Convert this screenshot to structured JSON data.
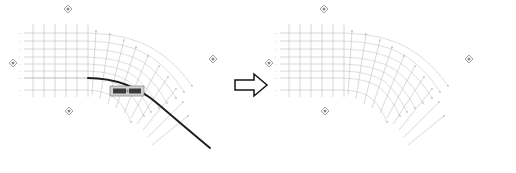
{
  "figure": {
    "panels": [
      {
        "id": "before",
        "label": "Before",
        "has_bold_curve": true,
        "has_tooltip": true,
        "bold_curve_name": "selected-boundary-curve"
      },
      {
        "id": "after",
        "label": "After",
        "has_bold_curve": false,
        "has_tooltip": false,
        "bold_curve_name": ""
      }
    ],
    "connector": {
      "icon": "right-arrow-icon",
      "label": "transforms to"
    },
    "grid": {
      "straight_columns": 6,
      "straight_rows": 8,
      "radial_lines": 10,
      "arc_count": 8,
      "line_color": "#b9b9b9",
      "arc_color": "#c2c2c2",
      "node_color": "#9a9a9a",
      "bold_curve_color": "#1c1c1c"
    },
    "markers": {
      "icon": "diamond-reference-marker",
      "color": "#8a8a8a",
      "positions": [
        "top",
        "left",
        "bottom",
        "right"
      ]
    },
    "tooltip": {
      "name": "selection-tooltip",
      "field_a": "",
      "field_b": "",
      "background": "#d2d2d2",
      "border": "#6e6e6e"
    },
    "tick_labels_left": [
      "8",
      "7",
      "6",
      "5",
      "4",
      "3",
      "2",
      "1"
    ],
    "tick_labels_top": [
      "A",
      "B",
      "C",
      "D",
      "E",
      "F"
    ]
  }
}
